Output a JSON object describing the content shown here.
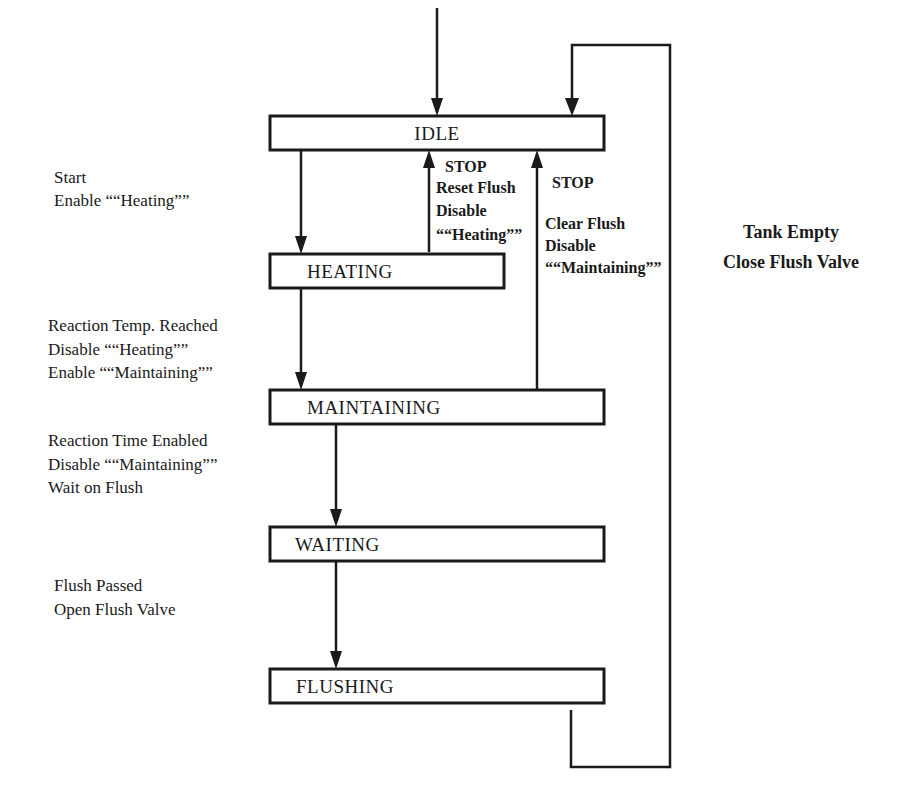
{
  "diagram": {
    "type": "state-transition",
    "colors": {
      "ink": "#1a1a1a",
      "background": "#ffffff"
    },
    "states": [
      {
        "id": "idle",
        "label": "IDLE"
      },
      {
        "id": "heating",
        "label": "HEATING"
      },
      {
        "id": "maintaining",
        "label": "MAINTAINING"
      },
      {
        "id": "waiting",
        "label": "WAITING"
      },
      {
        "id": "flushing",
        "label": "FLUSHING"
      }
    ],
    "transitions": [
      {
        "from": "start",
        "to": "idle",
        "lines": []
      },
      {
        "from": "idle",
        "to": "heating",
        "lines": [
          "Start",
          "Enable ““Heating””"
        ]
      },
      {
        "from": "heating",
        "to": "idle",
        "lines": [
          "STOP",
          "Reset Flush",
          "Disable",
          "““Heating””"
        ]
      },
      {
        "from": "maintaining",
        "to": "idle",
        "lines": [
          "STOP",
          "Clear Flush",
          "Disable",
          "““Maintaining””"
        ]
      },
      {
        "from": "heating",
        "to": "maintaining",
        "lines": [
          "Reaction Temp. Reached",
          "Disable ““Heating””",
          "Enable ““Maintaining””"
        ]
      },
      {
        "from": "maintaining",
        "to": "waiting",
        "lines": [
          "Reaction Time Enabled",
          "Disable ““Maintaining””",
          "Wait on Flush"
        ]
      },
      {
        "from": "waiting",
        "to": "flushing",
        "lines": [
          "Flush Passed",
          "Open Flush Valve"
        ]
      },
      {
        "from": "flushing",
        "to": "idle",
        "lines": [
          "Tank Empty",
          "Close Flush Valve"
        ]
      }
    ]
  }
}
